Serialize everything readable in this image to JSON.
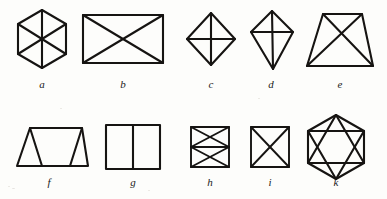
{
  "plate": {
    "title": "Geometric line-drawing figures plate",
    "background_color": "#fdfdfb",
    "stroke_color": "#161412",
    "width": 387,
    "height": 199,
    "rows": 2,
    "figure_count": 10
  },
  "figures": [
    {
      "id": "a",
      "label": "a",
      "name": "hexagon-with-three-diameters",
      "description": "Regular hexagon with pointed top and bottom, divided into six triangles by three diameters through the centre",
      "row": 1,
      "column": 1
    },
    {
      "id": "b",
      "label": "b",
      "name": "rectangle-with-both-diagonals",
      "description": "Wide rectangle crossed by both diagonals forming an X",
      "row": 1,
      "column": 2
    },
    {
      "id": "c",
      "label": "c",
      "name": "rhombus-with-axes",
      "description": "Diamond (rhombus) standing on a point with vertical and horizontal axes drawn through the centre",
      "row": 1,
      "column": 3
    },
    {
      "id": "d",
      "label": "d",
      "name": "kite-with-axes",
      "description": "Kite shape with a long lower point, a vertical axis and a horizontal crossbar",
      "row": 1,
      "column": 4
    },
    {
      "id": "e",
      "label": "e",
      "name": "trapezoid-with-both-diagonals",
      "description": "Trapezoid with a narrow top and wide base, crossed by both diagonals",
      "row": 1,
      "column": 5
    },
    {
      "id": "f",
      "label": "f",
      "name": "trapezoid-with-two-inner-triangles",
      "description": "Trapezoid with two internal slanted lines creating a triangle at each end",
      "row": 2,
      "column": 1
    },
    {
      "id": "g",
      "label": "g",
      "name": "square-split-by-vertical-line",
      "description": "Upright square divided into two panels by a single vertical line",
      "row": 2,
      "column": 2
    },
    {
      "id": "h",
      "label": "h",
      "name": "rectangle-with-midline-and-two-crosses",
      "description": "Small rectangle with a horizontal midline and an X drawn in each of the two halves",
      "row": 2,
      "column": 3
    },
    {
      "id": "i",
      "label": "i",
      "name": "square-with-both-diagonals",
      "description": "Small square crossed by both diagonals forming an X",
      "row": 2,
      "column": 4
    },
    {
      "id": "k",
      "label": "k",
      "name": "hexagon-with-inscribed-hexagram",
      "description": "Hexagon containing an inscribed six-pointed star formed by two overlapping triangles",
      "row": 2,
      "column": 5
    }
  ]
}
